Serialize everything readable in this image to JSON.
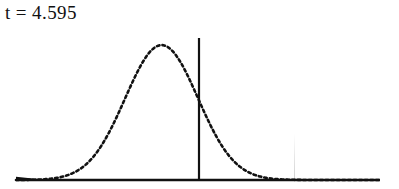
{
  "figure": {
    "label": "t = 4.595",
    "label_name": "t-statistic-label",
    "colors": {
      "ink": "#111111",
      "background": "#ffffff",
      "shaded_region": "#000000"
    }
  },
  "chart_data": {
    "type": "line",
    "title": "t = 4.595",
    "subtitle": "",
    "xlabel": "",
    "ylabel": "",
    "grid": false,
    "legend": null,
    "distribution": "t-distribution (bell curve)",
    "curve_style": "dotted",
    "mean": 0,
    "xlim": [
      -4.0,
      6.0
    ],
    "ylim": [
      0,
      0.42
    ],
    "axis_pixel_extent": {
      "x_left": 16,
      "x_right": 380,
      "baseline_y": 180
    },
    "peak_pixel": {
      "x": 200,
      "y": 38
    },
    "center_line": {
      "label": "mean",
      "x_value": 0,
      "x_pixel": 199,
      "y_top_pixel": 38,
      "y_bottom_pixel": 180,
      "style": "solid"
    },
    "shaded_region": {
      "label": "rejection region (right tail)",
      "fill": "#000000",
      "from_x_value": 2.6,
      "to_x_value": 6.0,
      "from_x_pixel": 294,
      "to_x_pixel": 380,
      "top_y_pixel": 133,
      "tail_side": "right"
    },
    "x": [
      -4.0,
      -3.8,
      -3.6,
      -3.4,
      -3.2,
      -3.0,
      -2.8,
      -2.6,
      -2.4,
      -2.2,
      -2.0,
      -1.8,
      -1.6,
      -1.4,
      -1.2,
      -1.0,
      -0.8,
      -0.6,
      -0.4,
      -0.2,
      0.0,
      0.2,
      0.4,
      0.6,
      0.8,
      1.0,
      1.2,
      1.4,
      1.6,
      1.8,
      2.0,
      2.2,
      2.4,
      2.6,
      2.8,
      3.0,
      3.2,
      3.4,
      3.6,
      3.8,
      4.0,
      4.2,
      4.4,
      4.6,
      4.8,
      5.0,
      5.2,
      5.4,
      5.6,
      5.8,
      6.0
    ],
    "y": [
      0.0001,
      0.0003,
      0.0006,
      0.0012,
      0.0024,
      0.0044,
      0.0079,
      0.0136,
      0.0224,
      0.0355,
      0.054,
      0.079,
      0.1109,
      0.1497,
      0.1942,
      0.242,
      0.2897,
      0.3332,
      0.3683,
      0.391,
      0.3989,
      0.391,
      0.3683,
      0.3332,
      0.2897,
      0.242,
      0.1942,
      0.1497,
      0.1109,
      0.079,
      0.054,
      0.0355,
      0.0224,
      0.0136,
      0.0079,
      0.0044,
      0.0024,
      0.0012,
      0.0006,
      0.0003,
      0.0001,
      0.0001,
      0.0,
      0.0,
      0.0,
      0.0,
      0.0,
      0.0,
      0.0,
      0.0,
      0.0
    ]
  }
}
